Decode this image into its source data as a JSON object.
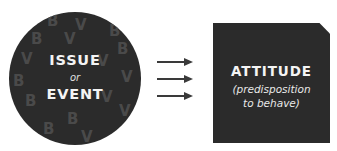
{
  "left_node": {
    "shape": "circle",
    "line1": "ISSUE",
    "connector": "or",
    "line2": "EVENT",
    "background_letters": [
      "B",
      "V",
      "B",
      "V",
      "B",
      "V",
      "B",
      "V",
      "B",
      "V",
      "B",
      "V",
      "B",
      "V",
      "B",
      "V"
    ],
    "fill_color": "#2b2b2b",
    "text_color": "#f4f4f4",
    "pattern_color": "#4a4a4a"
  },
  "connector": {
    "arrow_count": 3,
    "direction": "right",
    "color": "#3a3a3a"
  },
  "right_node": {
    "shape": "square",
    "title": "ATTITUDE",
    "subtitle_line1": "(predisposition",
    "subtitle_line2": "to behave)",
    "fill_color": "#2b2b2b",
    "text_color": "#f4f4f4"
  }
}
